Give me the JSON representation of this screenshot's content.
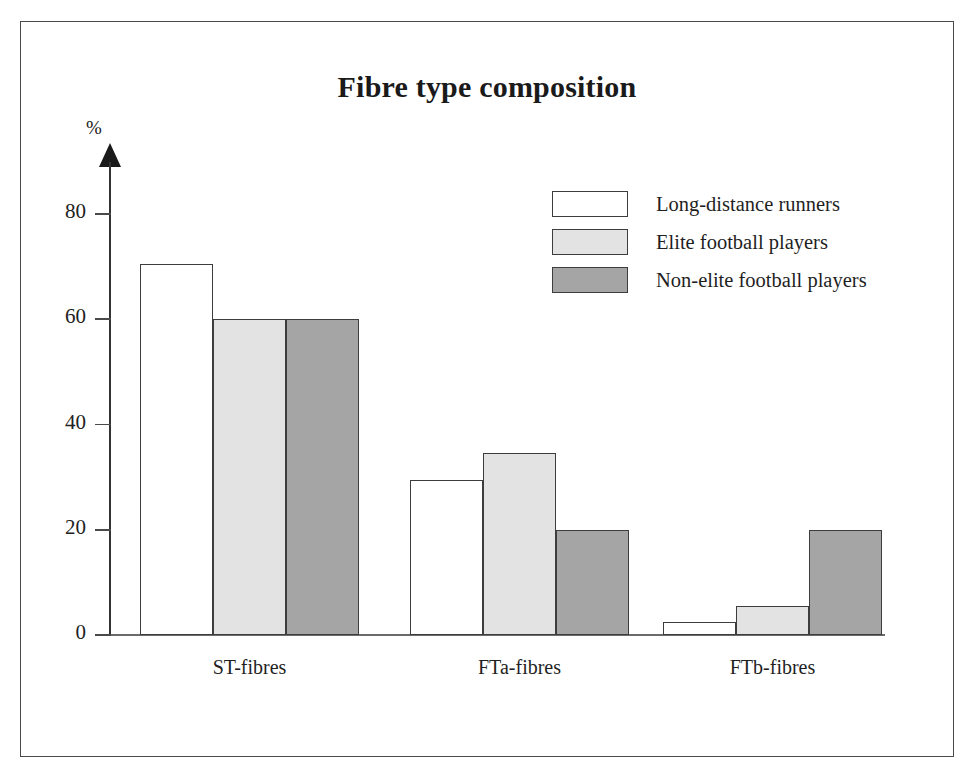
{
  "figure": {
    "title": "Fibre type composition",
    "y_axis_unit": "%"
  },
  "chart_data": {
    "type": "bar",
    "title": "Fibre type composition",
    "xlabel": "",
    "ylabel": "%",
    "ylim": [
      0,
      88
    ],
    "yticks": [
      0,
      20,
      40,
      60,
      80
    ],
    "grid": false,
    "legend_position": "top-right",
    "categories": [
      "ST-fibres",
      "FTa-fibres",
      "FTb-fibres"
    ],
    "series": [
      {
        "name": "Long-distance runners",
        "color": "#ffffff",
        "values": [
          70.5,
          29.5,
          2.5
        ]
      },
      {
        "name": "Elite football players",
        "color": "#e3e3e3",
        "values": [
          60,
          34.5,
          5.5
        ]
      },
      {
        "name": "Non-elite football players",
        "color": "#a5a5a5",
        "values": [
          60,
          20,
          20
        ]
      }
    ]
  },
  "axis": {
    "tick_labels": [
      "80",
      "60",
      "40",
      "20",
      "0"
    ]
  },
  "legend": {
    "items": [
      {
        "label": "Long-distance runners"
      },
      {
        "label": "Elite football players"
      },
      {
        "label": "Non-elite football players"
      }
    ]
  },
  "colors": {
    "series_1": "#ffffff",
    "series_2": "#e3e3e3",
    "series_3": "#a5a5a5",
    "outline": "#3d3d3d",
    "frame": "#4a4a4a"
  }
}
